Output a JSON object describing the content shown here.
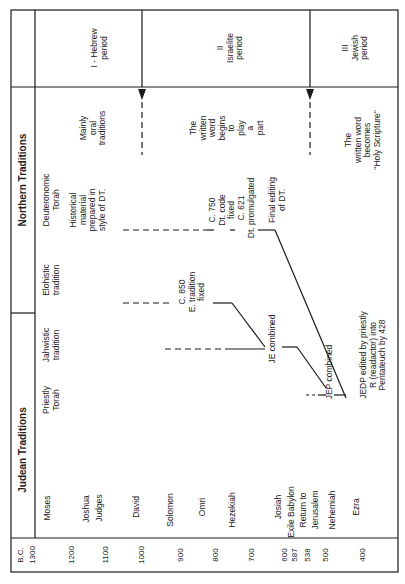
{
  "orientation": "rotated-90-ccw",
  "header": {
    "judean_traditions": "Judean Traditions",
    "northern_traditions": "Northern Traditions"
  },
  "columns": {
    "priestly": [
      "Priestly",
      "Torah"
    ],
    "jahwistic": [
      "Jahwistic",
      "tradition"
    ],
    "elohistic": [
      "Elohistic",
      "tradition"
    ],
    "deuteronomic": [
      "Deuteronomic",
      "Torah"
    ]
  },
  "periods": [
    {
      "lines": [
        "I - Hebrew",
        "period"
      ],
      "note": [
        "Mainly",
        "oral",
        "traditions"
      ]
    },
    {
      "lines": [
        "II",
        "Israelite",
        "period"
      ],
      "note": [
        "The",
        "written",
        "word",
        "begins",
        "to",
        "play",
        "a",
        "part"
      ]
    },
    {
      "lines": [
        "III",
        "Jewish",
        "period"
      ],
      "note": [
        "The",
        "written word",
        "becomes",
        "\"Holy Scripture\""
      ]
    }
  ],
  "timeline": {
    "era_label": "B.C.",
    "entries": [
      {
        "year": "1300",
        "event": "Moses"
      },
      {
        "year": "1200",
        "event": "Joshua"
      },
      {
        "year": "1100",
        "event": "Judges"
      },
      {
        "year": "1000",
        "event": "David"
      },
      {
        "year": "900",
        "event": "Solomon"
      },
      {
        "year": "800",
        "event": "Omri"
      },
      {
        "year": "700",
        "event": "Hezekiah"
      },
      {
        "year": "600",
        "event": "Josiah"
      },
      {
        "year": "587",
        "event": "Exile Babylon"
      },
      {
        "year": "538",
        "event": "Return to"
      },
      {
        "year": "",
        "event": "Jerusalem"
      },
      {
        "year": "500",
        "event": "Nehemiah"
      },
      {
        "year": "400",
        "event": "Ezra"
      }
    ]
  },
  "annotations": {
    "deut_historical": [
      "Historical",
      "material",
      "prepared in",
      "style of DT."
    ],
    "c750": [
      "C. 750",
      "Dt. code",
      "fixed"
    ],
    "c621": [
      "C. 621",
      "Dt. promulgated"
    ],
    "final_editing": [
      "Final editing",
      "of DT."
    ],
    "c850": [
      "C. 850",
      "E. tradition",
      "fixed"
    ],
    "je_combined": "JE combined",
    "jep_combined": "JEP combined",
    "jedp": [
      "JEDP edited by priestly",
      "R (readactor) into",
      "Pentateuch by 428"
    ]
  },
  "colors": {
    "ink": "#1a1a1a",
    "paper": "#ffffff"
  }
}
